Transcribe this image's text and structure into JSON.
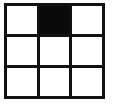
{
  "figure": {
    "grid_rows": 3,
    "grid_columns": 3,
    "line_color": "#111111",
    "background_color": "#ffffff",
    "fill_color": "#0a0a0a",
    "empty_color": "#ffffff",
    "line_thickness_px": 3,
    "cells": [
      {
        "row": 0,
        "col": 0,
        "name": "cell-top-left",
        "state": "empty",
        "color": "#ffffff"
      },
      {
        "row": 0,
        "col": 1,
        "name": "cell-top-center",
        "state": "filled",
        "color": "#0a0a0a"
      },
      {
        "row": 0,
        "col": 2,
        "name": "cell-top-right",
        "state": "empty",
        "color": "#ffffff"
      },
      {
        "row": 1,
        "col": 0,
        "name": "cell-middle-left",
        "state": "empty",
        "color": "#ffffff"
      },
      {
        "row": 1,
        "col": 1,
        "name": "cell-middle-center",
        "state": "empty",
        "color": "#ffffff"
      },
      {
        "row": 1,
        "col": 2,
        "name": "cell-middle-right",
        "state": "empty",
        "color": "#ffffff"
      },
      {
        "row": 2,
        "col": 0,
        "name": "cell-bottom-left",
        "state": "empty",
        "color": "#ffffff"
      },
      {
        "row": 2,
        "col": 1,
        "name": "cell-bottom-center",
        "state": "empty",
        "color": "#ffffff"
      },
      {
        "row": 2,
        "col": 2,
        "name": "cell-bottom-right",
        "state": "empty",
        "color": "#ffffff"
      }
    ]
  }
}
